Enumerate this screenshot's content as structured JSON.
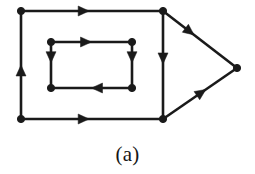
{
  "figure": {
    "caption": "(a)",
    "kind": "directed-graph-diagram",
    "width": 255,
    "height": 174,
    "background_color": "#ffffff",
    "stroke_color": "#1a1a1a",
    "node_fill_color": "#1a1a1a",
    "edge_stroke_width": 2.6,
    "node_radius": 3.6,
    "arrow_length": 11,
    "arrow_half_width": 5
  },
  "graph": {
    "node_count": 9,
    "edge_count": 10,
    "nodes": [
      {
        "id": "outer-top-left",
        "label": "",
        "x": 21,
        "y": 11
      },
      {
        "id": "outer-top-right",
        "label": "",
        "x": 163,
        "y": 11
      },
      {
        "id": "outer-bottom-right",
        "label": "",
        "x": 163,
        "y": 119
      },
      {
        "id": "outer-bottom-left",
        "label": "",
        "x": 21,
        "y": 119
      },
      {
        "id": "inner-top-left",
        "label": "",
        "x": 51,
        "y": 42
      },
      {
        "id": "inner-top-right",
        "label": "",
        "x": 132,
        "y": 42
      },
      {
        "id": "inner-bottom-right",
        "label": "",
        "x": 132,
        "y": 88
      },
      {
        "id": "inner-bottom-left",
        "label": "",
        "x": 51,
        "y": 88
      },
      {
        "id": "right-apex",
        "label": "",
        "x": 237,
        "y": 68
      }
    ],
    "edges": [
      {
        "id": "edge-outer-top",
        "from": "outer-top-left",
        "to": "outer-top-right",
        "arrow_at": 0.48,
        "direction": "right"
      },
      {
        "id": "edge-outer-left",
        "from": "outer-bottom-left",
        "to": "outer-top-left",
        "arrow_at": 0.5,
        "direction": "up"
      },
      {
        "id": "edge-outer-right",
        "from": "outer-top-right",
        "to": "outer-bottom-right",
        "arrow_at": 0.49,
        "direction": "down"
      },
      {
        "id": "edge-outer-bottom",
        "from": "outer-bottom-left",
        "to": "outer-bottom-right",
        "arrow_at": 0.48,
        "direction": "right"
      },
      {
        "id": "edge-inner-top",
        "from": "inner-top-left",
        "to": "inner-top-right",
        "arrow_at": 0.5,
        "direction": "right"
      },
      {
        "id": "edge-inner-left",
        "from": "inner-top-left",
        "to": "inner-bottom-left",
        "arrow_at": 0.45,
        "direction": "down"
      },
      {
        "id": "edge-inner-right",
        "from": "inner-top-right",
        "to": "inner-bottom-right",
        "arrow_at": 0.45,
        "direction": "down"
      },
      {
        "id": "edge-inner-bottom",
        "from": "inner-bottom-right",
        "to": "inner-bottom-left",
        "arrow_at": 0.5,
        "direction": "left"
      },
      {
        "id": "edge-upper-diagonal",
        "from": "outer-top-right",
        "to": "right-apex",
        "arrow_at": 0.42,
        "direction": "down-right"
      },
      {
        "id": "edge-lower-diagonal",
        "from": "outer-bottom-right",
        "to": "right-apex",
        "arrow_at": 0.58,
        "direction": "up-right"
      }
    ]
  }
}
